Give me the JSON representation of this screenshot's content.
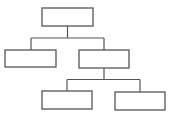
{
  "diagram": {
    "type": "tree",
    "title": "",
    "stroke_color": "#555555",
    "background": "#ffffff",
    "nodes": [
      {
        "id": "root",
        "label": "",
        "x": 42,
        "y": 8,
        "w": 51,
        "h": 18
      },
      {
        "id": "child-left",
        "label": "",
        "x": 5,
        "y": 50,
        "w": 51,
        "h": 17
      },
      {
        "id": "child-right",
        "label": "",
        "x": 79,
        "y": 50,
        "w": 50,
        "h": 18
      },
      {
        "id": "grandchild-left",
        "label": "",
        "x": 42,
        "y": 91,
        "w": 50,
        "h": 18
      },
      {
        "id": "grandchild-right",
        "label": "",
        "x": 115,
        "y": 92,
        "w": 50,
        "h": 18
      }
    ],
    "edges": [
      {
        "from": "root",
        "to": "child-left"
      },
      {
        "from": "root",
        "to": "child-right"
      },
      {
        "from": "child-right",
        "to": "grandchild-left"
      },
      {
        "from": "child-right",
        "to": "grandchild-right"
      }
    ]
  }
}
